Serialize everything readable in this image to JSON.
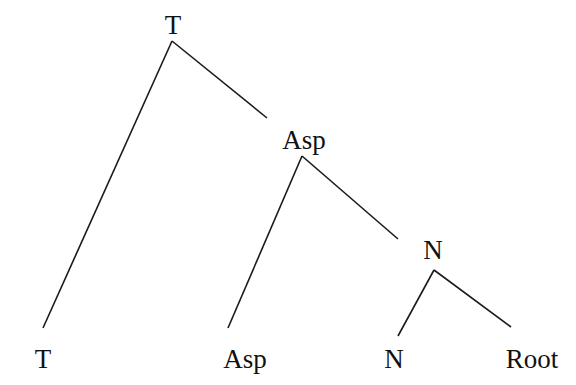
{
  "diagram": {
    "type": "syntax-tree",
    "nodes": [
      {
        "id": "T_top",
        "label": "T",
        "x": 173,
        "y": 12
      },
      {
        "id": "Asp_mid",
        "label": "Asp",
        "x": 304,
        "y": 127
      },
      {
        "id": "N_mid",
        "label": "N",
        "x": 433,
        "y": 237
      },
      {
        "id": "T_leaf",
        "label": "T",
        "x": 43,
        "y": 346
      },
      {
        "id": "Asp_leaf",
        "label": "Asp",
        "x": 245,
        "y": 346
      },
      {
        "id": "N_leaf",
        "label": "N",
        "x": 394,
        "y": 346
      },
      {
        "id": "Root_leaf",
        "label": "Root",
        "x": 532,
        "y": 346
      }
    ],
    "edges": [
      {
        "from": "T_top",
        "to": "T_leaf",
        "x1": 172,
        "y1": 41,
        "x2": 43,
        "y2": 328
      },
      {
        "from": "T_top",
        "to": "Asp_mid",
        "x1": 172,
        "y1": 41,
        "x2": 267,
        "y2": 118
      },
      {
        "from": "Asp_mid",
        "to": "Asp_leaf",
        "x1": 302,
        "y1": 156,
        "x2": 228,
        "y2": 328
      },
      {
        "from": "Asp_mid",
        "to": "N_mid",
        "x1": 302,
        "y1": 156,
        "x2": 398,
        "y2": 239
      },
      {
        "from": "N_mid",
        "to": "N_leaf",
        "x1": 434,
        "y1": 270,
        "x2": 398,
        "y2": 336
      },
      {
        "from": "N_mid",
        "to": "Root_leaf",
        "x1": 434,
        "y1": 270,
        "x2": 511,
        "y2": 327
      }
    ]
  }
}
